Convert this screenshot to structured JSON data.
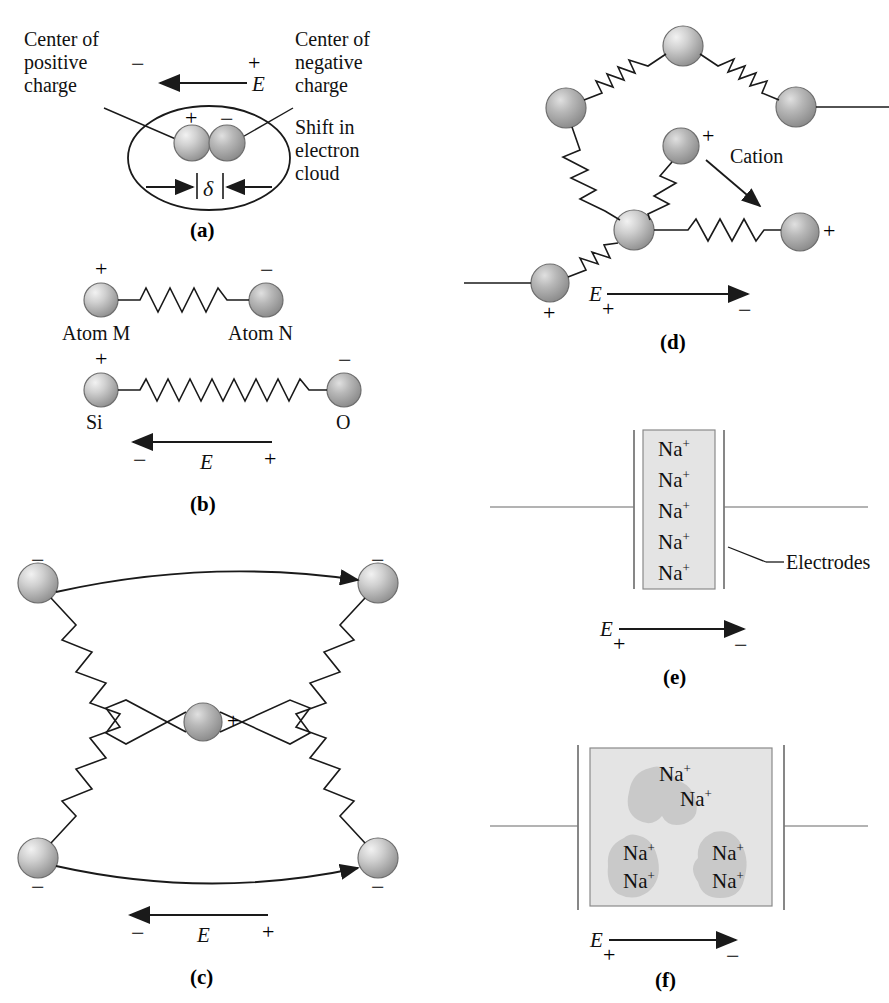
{
  "figure": {
    "background": "#ffffff",
    "width": 889,
    "height": 1003
  },
  "symbols": {
    "plus": "+",
    "minus": "−",
    "efield": "E",
    "delta": "δ",
    "sodium_ion": "Na",
    "sodium_sup": "+"
  },
  "panels": {
    "a": {
      "tag": "(a)",
      "labels": {
        "center_positive": "Center of\npositive\ncharge",
        "center_negative": "Center of\nnegative\ncharge",
        "shift": "Shift in\nelectron\ncloud"
      },
      "field_left_sign": "−",
      "field_right_sign": "+",
      "field_symbol": "E",
      "atom_plus_sign": "+",
      "atom_minus_sign": "−",
      "delta_symbol": "δ"
    },
    "b": {
      "tag": "(b)",
      "row1": {
        "left_label": "Atom M",
        "right_label": "Atom N",
        "left_sign": "+",
        "right_sign": "−"
      },
      "row2": {
        "left_label": "Si",
        "right_label": "O",
        "left_sign": "+",
        "right_sign": "−"
      },
      "field_symbol": "E",
      "field_left_sign": "−",
      "field_right_sign": "+"
    },
    "c": {
      "tag": "(c)",
      "corner_signs": [
        "−",
        "−",
        "−",
        "−"
      ],
      "center_sign": "+",
      "field_symbol": "E",
      "field_left_sign": "−",
      "field_right_sign": "+"
    },
    "d": {
      "tag": "(d)",
      "cation_label": "Cation",
      "free_ion_sign": "+",
      "right_ion_sign": "+",
      "bottom_left_sign": "+",
      "field_symbol": "E",
      "field_left_sign": "+",
      "field_right_sign": "−"
    },
    "e": {
      "tag": "(e)",
      "electrodes_label": "Electrodes",
      "ions": [
        "Na",
        "Na",
        "Na",
        "Na",
        "Na"
      ],
      "ion_count": 5,
      "field_symbol": "E",
      "field_left_sign": "+",
      "field_right_sign": "−"
    },
    "f": {
      "tag": "(f)",
      "ions": [
        "Na",
        "Na",
        "Na",
        "Na",
        "Na",
        "Na"
      ],
      "ion_count": 6,
      "field_symbol": "E",
      "field_left_sign": "+",
      "field_right_sign": "−"
    }
  },
  "colors": {
    "stroke": "#1a1a1a",
    "sphere_light": "#e8e8e8",
    "sphere_mid": "#b4b4b4",
    "sphere_dark": "#8a8a8a",
    "box_fill": "#e4e4e4",
    "blob_fill": "#c9c9c9",
    "electrode_line": "#9a9a9a"
  }
}
